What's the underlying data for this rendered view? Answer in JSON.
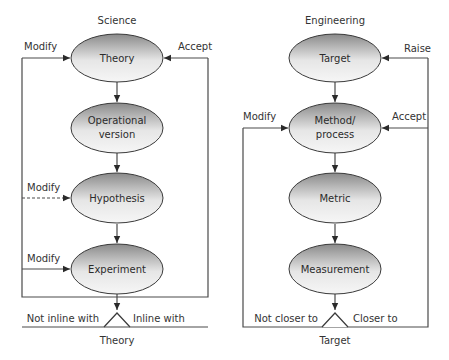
{
  "science": {
    "title": "Science",
    "nodes": [
      {
        "label": [
          "Theory"
        ]
      },
      {
        "label": [
          "Operational",
          "version"
        ]
      },
      {
        "label": [
          "Hypothesis"
        ]
      },
      {
        "label": [
          "Experiment"
        ]
      }
    ],
    "edge_labels": {
      "modify_top": "Modify",
      "accept": "Accept",
      "modify_hypothesis": "Modify",
      "modify_experiment": "Modify",
      "not_inline": "Not inline with",
      "inline": "Inline with",
      "decision": "Theory"
    }
  },
  "engineering": {
    "title": "Engineering",
    "nodes": [
      {
        "label": [
          "Target"
        ]
      },
      {
        "label": [
          "Method/",
          "process"
        ]
      },
      {
        "label": [
          "Metric"
        ]
      },
      {
        "label": [
          "Measurement"
        ]
      }
    ],
    "edge_labels": {
      "raise": "Raise",
      "modify": "Modify",
      "accept": "Accept",
      "not_closer": "Not closer to",
      "closer": "Closer to",
      "decision": "Target"
    }
  },
  "colors": {
    "gradient_light": "#f4f4f4",
    "gradient_dark": "#8a8a8a",
    "line": "#4a4a4a"
  }
}
